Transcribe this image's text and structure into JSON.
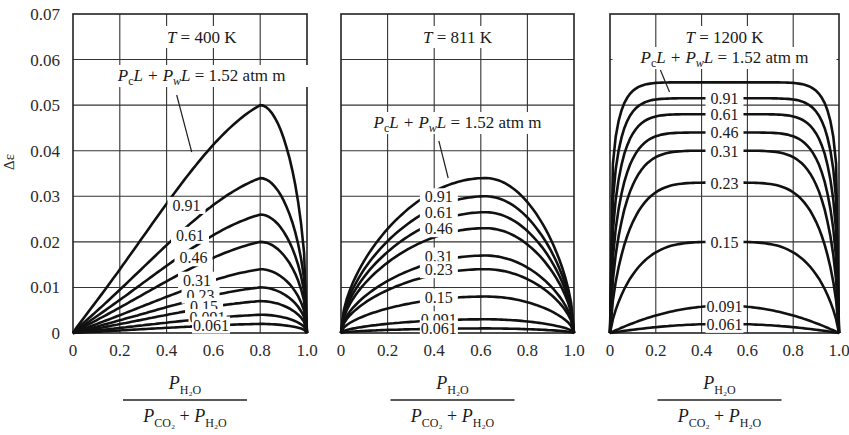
{
  "chart_data": [
    {
      "type": "line",
      "title": "T = 400 K",
      "parameter_label": "P_c L + P_w L = 1.52 atm m",
      "xlabel": "P_H2O / (P_CO2 + P_H2O)",
      "ylabel": "Δε",
      "xlim": [
        0,
        1.0
      ],
      "ylim": [
        0,
        0.07
      ],
      "xticks": [
        "0",
        "0.2",
        "0.4",
        "0.6",
        "0.8",
        "1.0"
      ],
      "yticks": [
        "0",
        "0.01",
        "0.02",
        "0.03",
        "0.04",
        "0.05",
        "0.06",
        "0.07"
      ],
      "grid": true,
      "peak_x": 0.8,
      "series": [
        {
          "name": "1.52",
          "peak": 0.05
        },
        {
          "name": "0.91",
          "peak": 0.034
        },
        {
          "name": "0.61",
          "peak": 0.026
        },
        {
          "name": "0.46",
          "peak": 0.02
        },
        {
          "name": "0.31",
          "peak": 0.014
        },
        {
          "name": "0.23",
          "peak": 0.01
        },
        {
          "name": "0.15",
          "peak": 0.007
        },
        {
          "name": "0.091",
          "peak": 0.004
        },
        {
          "name": "0.061",
          "peak": 0.002
        }
      ]
    },
    {
      "type": "line",
      "title": "T = 811 K",
      "parameter_label": "P_c L + P_w L = 1.52 atm m",
      "xlabel": "P_H2O / (P_CO2 + P_H2O)",
      "ylabel": "Δε",
      "xlim": [
        0,
        1.0
      ],
      "ylim": [
        0,
        0.07
      ],
      "xticks": [
        "0",
        "0.2",
        "0.4",
        "0.6",
        "0.8",
        "1.0"
      ],
      "grid": true,
      "peak_x": 0.62,
      "series": [
        {
          "name": "1.52",
          "peak": 0.034
        },
        {
          "name": "0.91",
          "peak": 0.03
        },
        {
          "name": "0.61",
          "peak": 0.0265
        },
        {
          "name": "0.46",
          "peak": 0.023
        },
        {
          "name": "0.31",
          "peak": 0.017
        },
        {
          "name": "0.23",
          "peak": 0.014
        },
        {
          "name": "0.15",
          "peak": 0.008
        },
        {
          "name": "0.091",
          "peak": 0.003
        },
        {
          "name": "0.061",
          "peak": 0.001
        }
      ]
    },
    {
      "type": "line",
      "title": "T = 1200 K",
      "parameter_label": "P_c L + P_w L = 1.52 atm m",
      "xlabel": "P_H2O / (P_CO2 + P_H2O)",
      "ylabel": "Δε",
      "xlim": [
        0,
        1.0
      ],
      "ylim": [
        0,
        0.07
      ],
      "xticks": [
        "0",
        "0.2",
        "0.4",
        "0.6",
        "0.8",
        "1.0"
      ],
      "grid": true,
      "peak_x": 0.5,
      "series": [
        {
          "name": "1.52",
          "peak": 0.055
        },
        {
          "name": "0.91",
          "peak": 0.0515
        },
        {
          "name": "0.61",
          "peak": 0.048
        },
        {
          "name": "0.46",
          "peak": 0.044
        },
        {
          "name": "0.31",
          "peak": 0.04
        },
        {
          "name": "0.23",
          "peak": 0.033
        },
        {
          "name": "0.15",
          "peak": 0.02
        },
        {
          "name": "0.091",
          "peak": 0.006
        },
        {
          "name": "0.061",
          "peak": 0.002
        }
      ]
    }
  ],
  "labels": {
    "ylabel": "Δε",
    "panel1_title": "T = 400 K",
    "panel2_title": "T = 811 K",
    "panel3_title": "T = 1200 K",
    "param_label": "1.52 atm m"
  }
}
